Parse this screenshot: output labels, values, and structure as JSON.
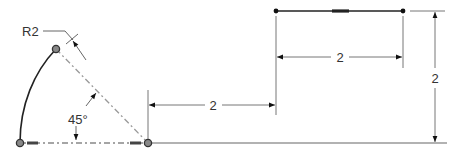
{
  "drawing": {
    "radius_label": "R2",
    "angle_label": "45°",
    "dim_bottom_horizontal": "2",
    "dim_top_horizontal": "2",
    "dim_vertical": "2"
  },
  "colors": {
    "geometry": "#222222",
    "dimension": "#555555",
    "point_fill": "#888888"
  }
}
